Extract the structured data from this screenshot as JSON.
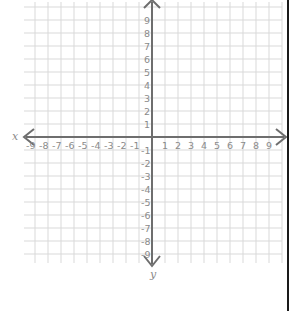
{
  "diagram": {
    "type": "coordinate-plane",
    "x_axis_label": "x",
    "y_axis_label": "y",
    "x_range": [
      -9,
      9
    ],
    "y_range": [
      -9,
      9
    ],
    "x_ticks": [
      "-9",
      "-8",
      "-7",
      "-6",
      "-5",
      "-4",
      "-3",
      "-2",
      "-1",
      "1",
      "2",
      "3",
      "4",
      "5",
      "6",
      "7",
      "8",
      "9"
    ],
    "y_ticks_positive": [
      "9",
      "8",
      "7",
      "6",
      "5",
      "4",
      "3",
      "2",
      "1"
    ],
    "y_ticks_negative": [
      "-1",
      "-2",
      "-3",
      "-4",
      "-5",
      "-6",
      "-7",
      "-8",
      "-9"
    ],
    "grid": true,
    "grid_step": 1,
    "colors": {
      "grid": "#d9d9d9",
      "axis": "#6e6e6e",
      "labels": "#8a8a8a",
      "border": "#1a1a1a"
    }
  }
}
